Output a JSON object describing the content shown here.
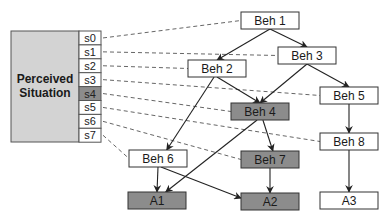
{
  "perceived_situation": {
    "label_line1": "Perceived",
    "label_line2": "Situation",
    "states": [
      {
        "id": "s0",
        "label": "s0",
        "highlighted": false,
        "target": "beh1"
      },
      {
        "id": "s1",
        "label": "s1",
        "highlighted": false,
        "target": "beh3"
      },
      {
        "id": "s2",
        "label": "s2",
        "highlighted": false,
        "target": "beh2"
      },
      {
        "id": "s3",
        "label": "s3",
        "highlighted": false,
        "target": "beh5"
      },
      {
        "id": "s4",
        "label": "s4",
        "highlighted": true,
        "target": "beh4"
      },
      {
        "id": "s5",
        "label": "s5",
        "highlighted": false,
        "target": "beh8"
      },
      {
        "id": "s6",
        "label": "s6",
        "highlighted": false,
        "target": "beh7"
      },
      {
        "id": "s7",
        "label": "s7",
        "highlighted": false,
        "target": "beh6"
      }
    ]
  },
  "nodes": {
    "beh1": {
      "label": "Beh 1",
      "highlighted": false
    },
    "beh2": {
      "label": "Beh 2",
      "highlighted": false
    },
    "beh3": {
      "label": "Beh 3",
      "highlighted": false
    },
    "beh4": {
      "label": "Beh 4",
      "highlighted": true
    },
    "beh5": {
      "label": "Beh 5",
      "highlighted": false
    },
    "beh6": {
      "label": "Beh 6",
      "highlighted": false
    },
    "beh7": {
      "label": "Beh 7",
      "highlighted": true
    },
    "beh8": {
      "label": "Beh 8",
      "highlighted": false
    },
    "a1": {
      "label": "A1",
      "highlighted": true
    },
    "a2": {
      "label": "A2",
      "highlighted": true
    },
    "a3": {
      "label": "A3",
      "highlighted": false
    }
  },
  "edges": [
    [
      "beh1",
      "beh2"
    ],
    [
      "beh1",
      "beh3"
    ],
    [
      "beh2",
      "beh4"
    ],
    [
      "beh2",
      "beh6"
    ],
    [
      "beh3",
      "beh4"
    ],
    [
      "beh3",
      "beh5"
    ],
    [
      "beh4",
      "beh7"
    ],
    [
      "beh4",
      "a1"
    ],
    [
      "beh5",
      "beh8"
    ],
    [
      "beh6",
      "a1"
    ],
    [
      "beh6",
      "a2"
    ],
    [
      "beh7",
      "a2"
    ],
    [
      "beh8",
      "a3"
    ]
  ],
  "colors": {
    "panel_fill": "#d3d3d3",
    "highlight_fill": "#8c8c8c",
    "node_fill": "#ffffff",
    "stroke": "#333333",
    "dash": "#555555"
  }
}
